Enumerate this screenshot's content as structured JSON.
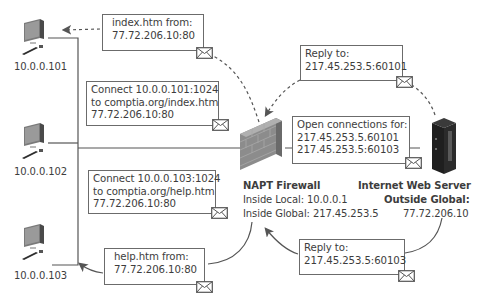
{
  "diagram": {
    "hosts": [
      {
        "label": "10.0.0.101"
      },
      {
        "label": "10.0.0.102"
      },
      {
        "label": "10.0.0.103"
      }
    ],
    "firewall": {
      "title": "NAPT Firewall",
      "inside_local": "Inside Local: 10.0.0.1",
      "inside_global": "Inside Global: 217.45.253.5"
    },
    "server": {
      "title": "Internet Web Server",
      "outside_global_label": "Outside Global:",
      "outside_global_value": "77.72.206.10"
    },
    "messages": {
      "index_from": [
        "index.htm from:",
        "77.72.206.10:80"
      ],
      "connect_101": [
        "Connect 10.0.0.101:1024",
        "to comptia.org/index.htm",
        "77.72.206.10:80"
      ],
      "connect_103": [
        "Connect 10.0.0.103:1024",
        "to comptia.org/help.htm",
        "77.72.206.10:80"
      ],
      "help_from": [
        "help.htm from:",
        "77.72.206.10:80"
      ],
      "reply_60101": [
        "Reply to:",
        "217.45.253.5:60101"
      ],
      "open_connections": [
        "Open connections for:",
        "217.45.253.5.60101",
        "217.45.253.5:60103"
      ],
      "reply_60103": [
        "Reply to:",
        "217.45.253.5:60103"
      ]
    },
    "icons": {
      "host": "desktop-computer-icon",
      "firewall": "brick-wall-icon",
      "server": "server-tower-icon",
      "message": "envelope-icon"
    },
    "colors": {
      "line": "#555555",
      "box_border": "#6b6b6b",
      "text": "#3d3d3d"
    }
  }
}
